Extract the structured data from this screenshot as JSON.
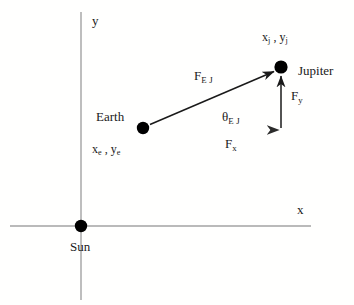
{
  "figure": {
    "background_color": "#fffffe",
    "axis_color": "#a0a0a0",
    "vector_color": "#1a1a1a",
    "fx_gradient": [
      "#3a3a3a",
      "#5c7a6a",
      "#b8342a",
      "#d43a2f"
    ]
  },
  "axes": {
    "x_label": "x",
    "y_label": "y",
    "x_axis": {
      "x1": 10,
      "y1": 226,
      "x2": 311,
      "y2": 226
    },
    "y_axis": {
      "x1": 81,
      "y1": 12,
      "x2": 81,
      "y2": 300
    }
  },
  "bodies": [
    {
      "name": "Sun",
      "label": "Sun",
      "cx": 81,
      "cy": 226,
      "r": 6
    },
    {
      "name": "Earth",
      "label": "Earth",
      "cx": 143,
      "cy": 128,
      "r": 6,
      "coord_x": "x",
      "coord_x_sub": "e",
      "coord_y": "y",
      "coord_y_sub": "e",
      "coord_sep": " , "
    },
    {
      "name": "Jupiter",
      "label": "Jupiter",
      "cx": 281,
      "cy": 67,
      "r": 6,
      "coord_x": "x",
      "coord_x_sub": "j",
      "coord_y": "y",
      "coord_y_sub": "j",
      "coord_sep": " , "
    }
  ],
  "vectors": [
    {
      "name": "F_EJ",
      "label_main": "F",
      "label_sub": "E J",
      "from": "Earth",
      "to": "Jupiter",
      "x1": 150,
      "y1": 124,
      "x2": 275,
      "y2": 71
    },
    {
      "name": "F_x",
      "label_main": "F",
      "label_sub": "x",
      "from": "Earth",
      "x1": 150,
      "y1": 130,
      "x2": 282,
      "y2": 130
    },
    {
      "name": "F_y",
      "label_main": "F",
      "label_sub": "y",
      "x1": 281,
      "y1": 128,
      "x2": 281,
      "y2": 74
    }
  ],
  "angle": {
    "name": "theta_EJ",
    "symbol": "θ",
    "subscript": "E J"
  }
}
